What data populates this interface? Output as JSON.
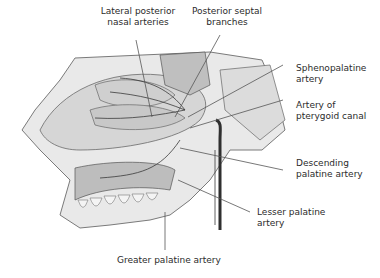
{
  "figure": {
    "labels": [
      {
        "id": "lateral-posterior-nasal-arteries",
        "text": "Lateral posterior\nnasal arteries"
      },
      {
        "id": "posterior-septal-branches",
        "text": "Posterior septal\nbranches"
      },
      {
        "id": "sphenopalatine-artery",
        "text": "Sphenopalatine\nartery"
      },
      {
        "id": "artery-of-pterygoid-canal",
        "text": "Artery of\npterygoid canal"
      },
      {
        "id": "descending-palatine-artery",
        "text": "Descending\npalatine artery"
      },
      {
        "id": "lesser-palatine-artery",
        "text": "Lesser palatine\nartery"
      },
      {
        "id": "greater-palatine-artery",
        "text": "Greater palatine artery"
      }
    ]
  }
}
